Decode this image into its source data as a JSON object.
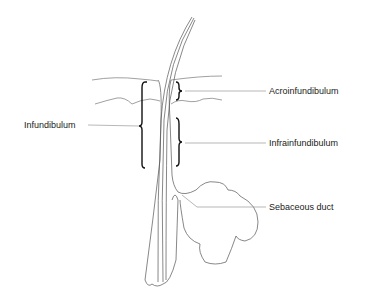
{
  "diagram": {
    "labels": {
      "acroinfundibulum": "Acroinfundibulum",
      "infundibulum": "Infundibulum",
      "infrainfundibulum": "Infrainfundibulum",
      "sebaceous_duct": "Sebaceous duct"
    },
    "colors": {
      "line": "#555555",
      "bracket": "#111111",
      "text": "#222222",
      "background": "#ffffff"
    }
  }
}
